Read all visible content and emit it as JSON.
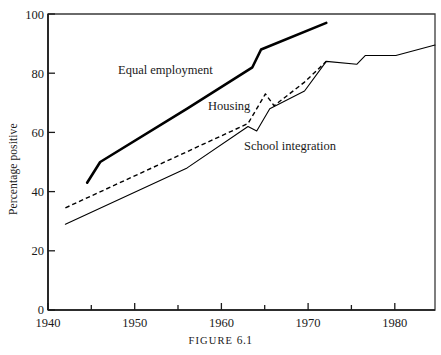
{
  "figure": {
    "caption_prefix": "FIGURE",
    "caption_number": "6.1"
  },
  "chart_data": {
    "type": "line",
    "title": "",
    "subtitle": "",
    "xlabel": "",
    "ylabel": "Percentage positive",
    "xlim": [
      1940,
      1984.5
    ],
    "ylim": [
      0,
      100
    ],
    "grid": false,
    "legend": "inline-annotations",
    "x_major_ticks": [
      1940,
      1950,
      1960,
      1970,
      1980
    ],
    "x_major_tick_labels": [
      "1940",
      "1950",
      "1960",
      "1970",
      "1980"
    ],
    "x_minor_ticks": [
      1945,
      1955,
      1965,
      1975
    ],
    "y_ticks": [
      0,
      20,
      40,
      60,
      80,
      100
    ],
    "y_tick_labels": [
      "0",
      "20",
      "40",
      "60",
      "80",
      "100"
    ],
    "series": [
      {
        "name": "Equal employment",
        "style": "thick-solid",
        "color": "#000000",
        "line_width": 2.6,
        "x": [
          1944.5,
          1946.0,
          1956.0,
          1963.5,
          1964.5,
          1972.0
        ],
        "values": [
          43,
          50,
          68,
          82,
          88,
          97
        ]
      },
      {
        "name": "Housing",
        "style": "dashed",
        "color": "#000000",
        "line_width": 1.4,
        "x": [
          1942.0,
          1963.0,
          1965.0,
          1966.0,
          1969.5,
          1972.0
        ],
        "values": [
          34.5,
          63,
          73,
          69,
          77,
          84
        ]
      },
      {
        "name": "School integration",
        "style": "thin-solid",
        "color": "#000000",
        "line_width": 1.1,
        "x": [
          1942.0,
          1956.0,
          1963.0,
          1964.0,
          1965.5,
          1969.5,
          1972.0,
          1975.5,
          1976.5,
          1980.0,
          1984.5
        ],
        "values": [
          29,
          48,
          62,
          60.5,
          68,
          74,
          84,
          83,
          86,
          86,
          89.5
        ]
      }
    ],
    "annotations": [
      {
        "text": "Equal employment",
        "x_px": 118,
        "y_px": 74
      },
      {
        "text": "Housing",
        "x_px": 208,
        "y_px": 110
      },
      {
        "text": "School integration",
        "x_px": 244,
        "y_px": 150
      }
    ]
  }
}
